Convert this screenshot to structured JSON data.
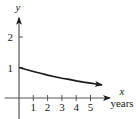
{
  "chart_data": {
    "type": "line",
    "title": "",
    "xlabel": "x",
    "xunit": "years",
    "ylabel": "y",
    "xlim": [
      -1,
      6.5
    ],
    "ylim": [
      -0.7,
      2.6
    ],
    "x_ticks": [
      1,
      2,
      3,
      4,
      5
    ],
    "x_tick_labels": [
      "1",
      "2",
      "3",
      "4",
      "5"
    ],
    "y_ticks": [
      1,
      2
    ],
    "y_tick_labels": [
      "1",
      "2"
    ],
    "grid": false,
    "legend": "none",
    "series": [
      {
        "name": "decay curve",
        "x": [
          0,
          0.5,
          1,
          1.5,
          2,
          2.5,
          3,
          3.5,
          4,
          4.5,
          5,
          5.5,
          5.8
        ],
        "y": [
          1.0,
          0.93,
          0.87,
          0.81,
          0.75,
          0.7,
          0.65,
          0.61,
          0.56,
          0.52,
          0.49,
          0.45,
          0.43
        ],
        "color": "#1a1a1a",
        "end_arrow": true
      }
    ]
  }
}
